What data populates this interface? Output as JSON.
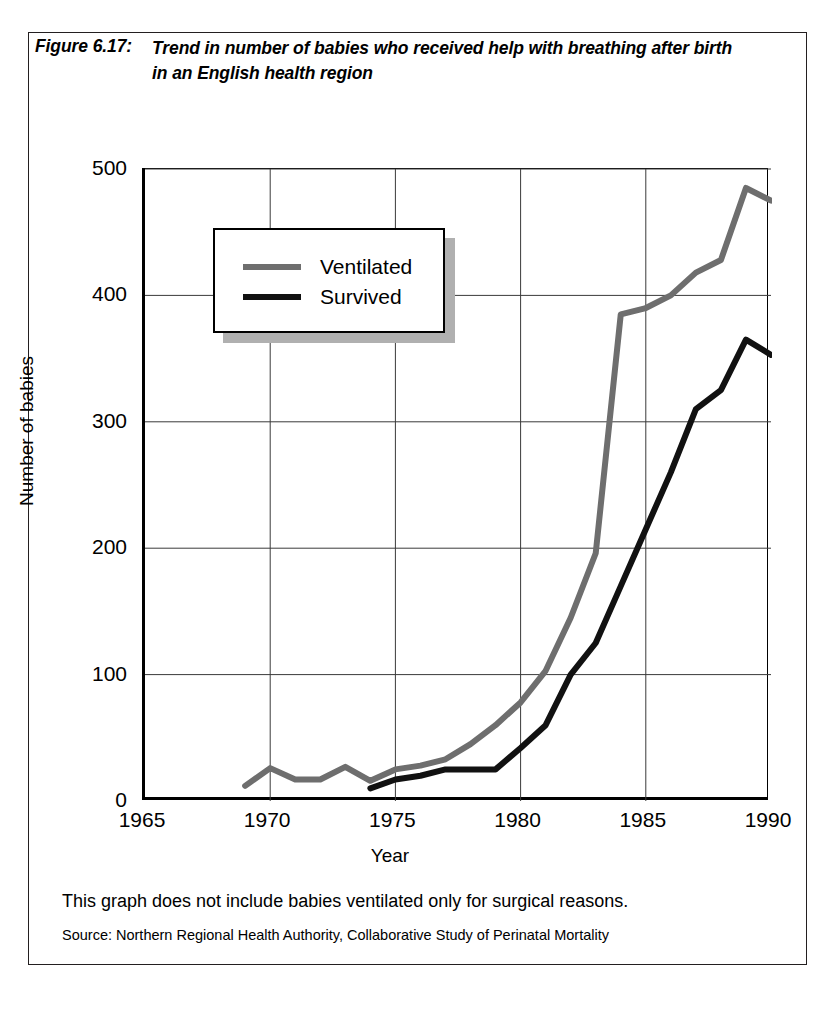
{
  "figure": {
    "label": "Figure 6.17:",
    "caption": "Trend in number of babies who received help with breathing after birth in an English health region"
  },
  "notes": {
    "main": "This graph does not include babies ventilated only for surgical reasons.",
    "source": "Source: Northern Regional Health Authority, Collaborative Study of Perinatal Mortality"
  },
  "legend": {
    "position": "inside-upper-left",
    "entries": [
      {
        "label": "Ventilated",
        "color": "#6e6e6e"
      },
      {
        "label": "Survived",
        "color": "#111111"
      }
    ]
  },
  "chart_data": {
    "type": "line",
    "title": "Trend in number of babies who received help with breathing after birth in an English health region",
    "xlabel": "Year",
    "ylabel": "Number of babies",
    "xlim": [
      1965,
      1990
    ],
    "ylim": [
      0,
      500
    ],
    "xticks": [
      1965,
      1970,
      1975,
      1980,
      1985,
      1990
    ],
    "yticks": [
      0,
      100,
      200,
      300,
      400,
      500
    ],
    "grid": true,
    "series": [
      {
        "name": "Ventilated",
        "color": "#6e6e6e",
        "x": [
          1969,
          1970,
          1971,
          1972,
          1973,
          1974,
          1975,
          1976,
          1977,
          1978,
          1979,
          1980,
          1981,
          1982,
          1983,
          1984,
          1985,
          1986,
          1987,
          1988,
          1989,
          1990
        ],
        "values": [
          12,
          26,
          17,
          17,
          27,
          16,
          25,
          28,
          33,
          45,
          60,
          78,
          103,
          145,
          196,
          385,
          390,
          400,
          418,
          428,
          485,
          475
        ]
      },
      {
        "name": "Survived",
        "color": "#111111",
        "x": [
          1974,
          1975,
          1976,
          1977,
          1978,
          1979,
          1980,
          1981,
          1982,
          1983,
          1984,
          1985,
          1986,
          1987,
          1988,
          1989,
          1990
        ],
        "values": [
          10,
          17,
          20,
          25,
          25,
          25,
          42,
          60,
          100,
          125,
          170,
          215,
          260,
          310,
          325,
          365,
          353
        ]
      }
    ]
  }
}
